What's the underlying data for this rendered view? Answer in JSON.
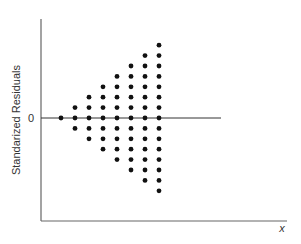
{
  "chart_data": {
    "type": "scatter",
    "title": "",
    "xlabel": "x",
    "ylabel": "Standarized Residuals",
    "y_tick_labels": [
      "0"
    ],
    "grid": false,
    "legend": null,
    "reference_line": {
      "y": 0
    },
    "x": [
      1,
      2,
      3,
      4,
      5,
      6,
      7,
      8
    ],
    "points_per_x": [
      {
        "x": 1,
        "y": [
          0
        ]
      },
      {
        "x": 2,
        "y": [
          -1,
          0,
          1
        ]
      },
      {
        "x": 3,
        "y": [
          -2,
          -1,
          0,
          1,
          2
        ]
      },
      {
        "x": 4,
        "y": [
          -3,
          -2,
          -1,
          0,
          1,
          2,
          3
        ]
      },
      {
        "x": 5,
        "y": [
          -4,
          -3,
          -2,
          -1,
          0,
          1,
          2,
          3,
          4
        ]
      },
      {
        "x": 6,
        "y": [
          -5,
          -4,
          -3,
          -2,
          -1,
          0,
          1,
          2,
          3,
          4,
          5
        ]
      },
      {
        "x": 7,
        "y": [
          -6,
          -5,
          -4,
          -3,
          -2,
          -1,
          0,
          1,
          2,
          3,
          4,
          5,
          6
        ]
      },
      {
        "x": 8,
        "y": [
          -7,
          -6,
          -5,
          -4,
          -3,
          -2,
          -1,
          0,
          1,
          2,
          3,
          4,
          5,
          6,
          7
        ]
      }
    ],
    "ylim": [
      -10,
      10
    ],
    "xlim": [
      0,
      18
    ],
    "colors": {
      "dot": "#111111",
      "axis": "#555555",
      "zero_line": "#222222"
    }
  }
}
